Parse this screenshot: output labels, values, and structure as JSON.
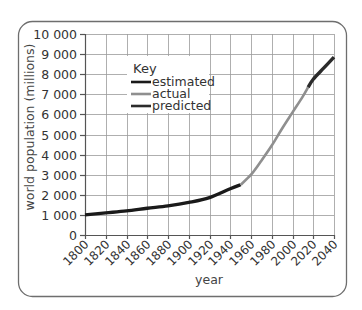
{
  "chart_data": {
    "type": "line",
    "title": "",
    "xlabel": "year",
    "ylabel": "world population (millions)",
    "xlim": [
      1800,
      2040
    ],
    "ylim": [
      0,
      10000
    ],
    "x_ticks": [
      1800,
      1820,
      1840,
      1860,
      1880,
      1900,
      1920,
      1940,
      1960,
      1980,
      2000,
      2020,
      2040
    ],
    "x_tick_labels": [
      "1800",
      "1820",
      "1840",
      "1860",
      "1880",
      "1900",
      "1920",
      "1940",
      "1960",
      "1980",
      "2000",
      "2020",
      "2040"
    ],
    "y_ticks": [
      0,
      1000,
      2000,
      3000,
      4000,
      5000,
      6000,
      7000,
      8000,
      9000,
      10000
    ],
    "y_tick_labels": [
      "0",
      "1 000",
      "2 000",
      "3 000",
      "4 000",
      "5 000",
      "6 000",
      "7 000",
      "8 000",
      "9 000",
      "10 000"
    ],
    "grid": true,
    "legend": {
      "title": "Key",
      "position": "upper left",
      "entries": [
        "estimated",
        "actual",
        "predicted"
      ]
    },
    "series": [
      {
        "name": "estimated",
        "color": "#1a1a1a",
        "x": [
          1800,
          1820,
          1840,
          1860,
          1880,
          1900,
          1920,
          1940,
          1950
        ],
        "values": [
          1000,
          1100,
          1200,
          1330,
          1450,
          1620,
          1860,
          2300,
          2500
        ]
      },
      {
        "name": "actual",
        "color": "#8f8f8f",
        "x": [
          1950,
          1960,
          1970,
          1980,
          1990,
          2000,
          2010,
          2015
        ],
        "values": [
          2500,
          3000,
          3700,
          4450,
          5300,
          6100,
          6900,
          7350
        ]
      },
      {
        "name": "predicted",
        "color": "#2b2b2b",
        "x": [
          2015,
          2020,
          2030,
          2040
        ],
        "values": [
          7350,
          7750,
          8300,
          8850
        ]
      }
    ]
  }
}
